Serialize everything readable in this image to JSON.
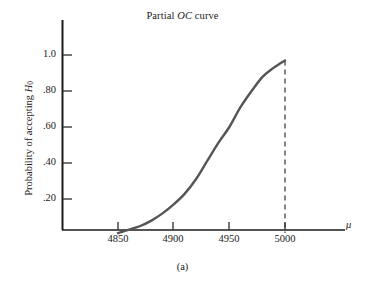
{
  "figure": {
    "title_prefix": "Partial ",
    "title_symbol": "OC",
    "title_suffix": " curve",
    "subcaption": "(a)",
    "background": "#ffffff",
    "axis_color": "#1a1a1a",
    "curve_color": "#555555",
    "dash_color": "#333333"
  },
  "chart_data": {
    "type": "line",
    "title": "Partial OC curve",
    "xlabel": "μ",
    "ylabel": "Probability of accepting H0",
    "ylabel_base": "Probability of accepting ",
    "ylabel_symbol": "H",
    "ylabel_subscript": "0",
    "xlim": [
      4825,
      5035
    ],
    "ylim": [
      0,
      1.12
    ],
    "grid": false,
    "legend": null,
    "xticks": [
      4850,
      4900,
      4950,
      5000
    ],
    "xtick_labels": [
      "4850",
      "4900",
      "4950",
      "5000"
    ],
    "yticks": [
      0.2,
      0.4,
      0.6,
      0.8,
      1.0
    ],
    "ytick_labels": [
      ".20",
      ".40",
      ".60",
      ".80",
      "1.0"
    ],
    "annotations": [
      {
        "name": "vertical-dashed-line",
        "x": 5000,
        "y_from": 0,
        "y_to": 0.97,
        "style": "dashed"
      }
    ],
    "series": [
      {
        "name": "OC curve",
        "x": [
          4850,
          4860,
          4870,
          4880,
          4890,
          4900,
          4910,
          4920,
          4930,
          4940,
          4950,
          4960,
          4970,
          4980,
          4990,
          5000
        ],
        "y": [
          0.01,
          0.03,
          0.05,
          0.08,
          0.12,
          0.17,
          0.23,
          0.31,
          0.41,
          0.51,
          0.6,
          0.71,
          0.8,
          0.88,
          0.93,
          0.97
        ]
      }
    ]
  },
  "x_tick_positions_px": [
    118,
    173,
    229,
    285
  ],
  "y_tick_positions_px": [
    199,
    163,
    127,
    91,
    55
  ],
  "mu_symbol": "μ"
}
